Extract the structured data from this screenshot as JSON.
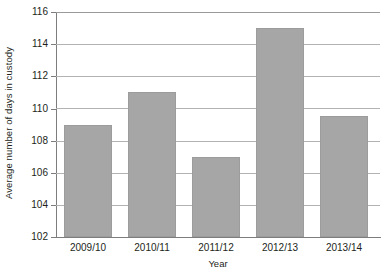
{
  "chart_data": {
    "type": "bar",
    "title": "",
    "subtitle": "",
    "xlabel": "Year",
    "ylabel": "Average number of days in custody",
    "categories": [
      "2009/10",
      "2010/11",
      "2011/12",
      "2012/13",
      "2013/14"
    ],
    "values": [
      109,
      111,
      107,
      115,
      109.5
    ],
    "series": [
      {
        "name": "Average number of days in custody",
        "values": [
          109,
          111,
          107,
          115,
          109.5
        ]
      }
    ],
    "ylim": [
      102,
      116
    ],
    "yticks": [
      102,
      104,
      106,
      108,
      110,
      112,
      114,
      116
    ],
    "ytick_labels": [
      "102",
      "104",
      "106",
      "108",
      "110",
      "112",
      "114",
      "116"
    ],
    "grid": true,
    "grid_axis": "y",
    "legend": false,
    "legend_position": "none",
    "bar_color": "#a6a6a6",
    "bar_edge_color": "#9c9c9c",
    "gridline_color": "#b3b3b3",
    "axis_color": "#7d7d7d",
    "text_color": "#231f20",
    "background": "#ffffff"
  }
}
